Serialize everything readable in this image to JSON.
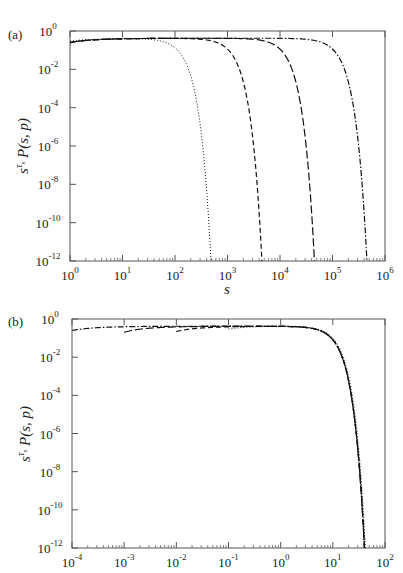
{
  "chart_data": [
    {
      "type": "line",
      "panel_label": "(a)",
      "title": "",
      "xlabel": "s",
      "ylabel": "s^{τ_s} P(s,p)",
      "xscale": "log",
      "yscale": "log",
      "xlim": [
        1,
        1000000
      ],
      "ylim": [
        1e-12,
        1
      ],
      "x_ticks": [
        {
          "base": "10",
          "exp": "0"
        },
        {
          "base": "10",
          "exp": "1"
        },
        {
          "base": "10",
          "exp": "2"
        },
        {
          "base": "10",
          "exp": "3"
        },
        {
          "base": "10",
          "exp": "4"
        },
        {
          "base": "10",
          "exp": "5"
        },
        {
          "base": "10",
          "exp": "6"
        }
      ],
      "y_ticks": [
        {
          "base": "10",
          "exp": "0"
        },
        {
          "base": "10",
          "exp": "-2"
        },
        {
          "base": "10",
          "exp": "-4"
        },
        {
          "base": "10",
          "exp": "-6"
        },
        {
          "base": "10",
          "exp": "-8"
        },
        {
          "base": "10",
          "exp": "-10"
        },
        {
          "base": "10",
          "exp": "-12"
        }
      ],
      "grid": false,
      "legend": "none",
      "series": [
        {
          "name": "curve-1",
          "style": "dotted",
          "plateau": 0.42,
          "start_value": 0.3,
          "cutoff": 300
        },
        {
          "name": "curve-2",
          "style": "dashed",
          "plateau": 0.42,
          "start_value": 0.25,
          "cutoff": 2800
        },
        {
          "name": "curve-3",
          "style": "long-dashed",
          "plateau": 0.42,
          "start_value": 0.25,
          "cutoff": 28000
        },
        {
          "name": "curve-4",
          "style": "dash-dot",
          "plateau": 0.42,
          "start_value": 0.25,
          "cutoff": 280000
        }
      ]
    },
    {
      "type": "line",
      "panel_label": "(b)",
      "title": "",
      "xlabel": "",
      "ylabel": "s^{τ_s} P(s,p)",
      "xscale": "log",
      "yscale": "log",
      "xlim": [
        0.0001,
        100
      ],
      "ylim": [
        1e-12,
        1
      ],
      "x_ticks": [
        {
          "base": "10",
          "exp": "-4"
        },
        {
          "base": "10",
          "exp": "-3"
        },
        {
          "base": "10",
          "exp": "-2"
        },
        {
          "base": "10",
          "exp": "-1"
        },
        {
          "base": "10",
          "exp": "0"
        },
        {
          "base": "10",
          "exp": "1"
        },
        {
          "base": "10",
          "exp": "2"
        }
      ],
      "y_ticks": [
        {
          "base": "10",
          "exp": "0"
        },
        {
          "base": "10",
          "exp": "-2"
        },
        {
          "base": "10",
          "exp": "-4"
        },
        {
          "base": "10",
          "exp": "-6"
        },
        {
          "base": "10",
          "exp": "-8"
        },
        {
          "base": "10",
          "exp": "-10"
        },
        {
          "base": "10",
          "exp": "-12"
        }
      ],
      "grid": false,
      "legend": "none",
      "series": [
        {
          "name": "curve-1",
          "style": "dotted",
          "x_start": 0.1,
          "start_value": 0.3,
          "plateau": 0.45,
          "cutoff": 26
        },
        {
          "name": "curve-2",
          "style": "dashed",
          "x_start": 0.01,
          "start_value": 0.22,
          "plateau": 0.42,
          "cutoff": 25
        },
        {
          "name": "curve-3",
          "style": "long-dashed",
          "x_start": 0.001,
          "start_value": 0.2,
          "plateau": 0.42,
          "cutoff": 25
        },
        {
          "name": "curve-4",
          "style": "dash-dot",
          "x_start": 0.0001,
          "start_value": 0.25,
          "plateau": 0.42,
          "cutoff": 25
        }
      ]
    }
  ]
}
